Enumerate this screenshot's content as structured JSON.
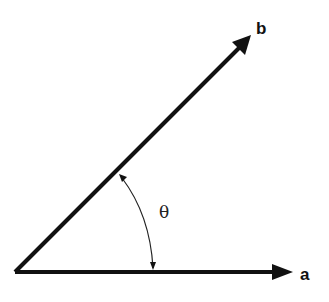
{
  "diagram": {
    "title": "",
    "vectors": [
      {
        "name": "a",
        "label": "a",
        "from": [
          15,
          272
        ],
        "to": [
          292,
          272
        ]
      },
      {
        "name": "b",
        "label": "b",
        "from": [
          15,
          272
        ],
        "to": [
          251,
          35
        ]
      }
    ],
    "angle": {
      "label": "θ",
      "between": [
        "a",
        "b"
      ]
    },
    "colors": {
      "stroke": "#111111",
      "background": "#ffffff"
    }
  }
}
